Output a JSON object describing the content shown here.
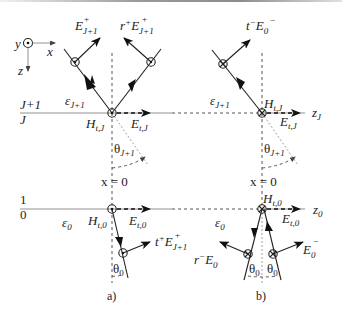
{
  "figure": {
    "axes_legend": {
      "y": "y",
      "x": "x",
      "z": "z"
    },
    "panel_a": {
      "caption": "a)",
      "top_interface": {
        "upper_layer": "J+1",
        "lower_layer": "J",
        "medium": "ε",
        "medium_sub": "J+1",
        "H_label": "H",
        "H_sub": "t,J",
        "E_label": "E",
        "E_sub": "t,J",
        "angle": "θ",
        "angle_sub": "J+1",
        "incident_wave": {
          "label": "E",
          "sup": "+",
          "sub": "J+1"
        },
        "reflected_wave": {
          "label": "r",
          "label_sup": "+",
          "E": "E",
          "sup": "+",
          "sub": "J+1"
        }
      },
      "normal_label": "x = 0",
      "bottom_interface": {
        "upper_layer": "1",
        "lower_layer": "0",
        "medium": "ε",
        "medium_sub": "0",
        "H_label": "H",
        "H_sub": "t,0",
        "E_label": "E",
        "E_sub": "t,0",
        "angle": "θ",
        "angle_sub": "0",
        "transmitted_wave": {
          "label": "t",
          "label_sup": "+",
          "E": "E",
          "sup": "+",
          "sub": "J+1"
        }
      }
    },
    "panel_b": {
      "caption": "b)",
      "top_interface": {
        "medium": "ε",
        "medium_sub": "J+1",
        "H_label": "H",
        "H_sub": "t,J",
        "E_label": "E",
        "E_sub": "t,J",
        "axis_label": "z",
        "axis_sub": "J",
        "angle": "θ",
        "angle_sub": "J+1",
        "transmitted_wave": {
          "label": "t",
          "label_sup": "−",
          "E": "E",
          "sup": "−",
          "sub": "0"
        }
      },
      "normal_label": "x = 0",
      "bottom_interface": {
        "medium": "ε",
        "medium_sub": "0",
        "H_label": "H",
        "H_sub": "t,0",
        "E_label": "E",
        "E_sub": "t,0",
        "axis_label": "z",
        "axis_sub": "0",
        "angle": "θ",
        "angle_sub": "0",
        "reflected_wave": {
          "label": "r",
          "label_sup": "−",
          "E": "E",
          "sub": "0"
        },
        "incident_wave": {
          "label": "E",
          "sup": "−",
          "sub": "0"
        }
      }
    }
  }
}
